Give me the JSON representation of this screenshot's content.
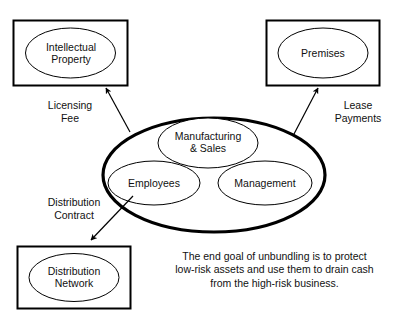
{
  "diagram": {
    "background_color": "#ffffff",
    "stroke_color": "#000000",
    "operating_entity": {
      "name": "operating-company",
      "border_style": "thick",
      "children": [
        {
          "label": "Manufacturing\n& Sales",
          "name": "manufacturing-and-sales"
        },
        {
          "label": "Employees",
          "name": "employees"
        },
        {
          "label": "Management",
          "name": "management"
        }
      ]
    },
    "asset_boxes": [
      {
        "label": "Intellectual\nProperty",
        "name": "intellectual-property",
        "position": "top-left"
      },
      {
        "label": "Premises",
        "name": "premises",
        "position": "top-right"
      },
      {
        "label": "Distribution\nNetwork",
        "name": "distribution-network",
        "position": "bottom-left"
      }
    ],
    "flows": [
      {
        "label": "Licensing\nFee",
        "name": "licensing-fee",
        "target": "intellectual-property"
      },
      {
        "label": "Lease\nPayments",
        "name": "lease-payments",
        "target": "premises"
      },
      {
        "label": "Distribution\nContract",
        "name": "distribution-contract",
        "target": "distribution-network"
      }
    ],
    "caption": "The end goal of unbundling is to protect\nlow-risk assets and use them to drain cash\nfrom the high-risk business."
  }
}
